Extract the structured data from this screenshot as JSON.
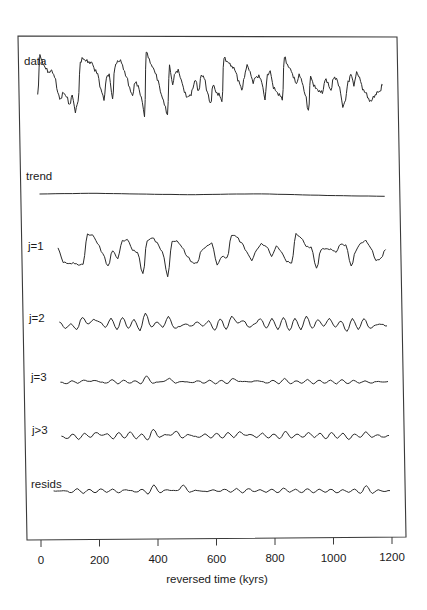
{
  "chart_data": {
    "type": "line",
    "title": "",
    "xlabel": "reversed time (kyrs)",
    "ylabel": "",
    "xlim": [
      0,
      1200
    ],
    "x_ticks": [
      0,
      200,
      400,
      600,
      800,
      1000,
      1200
    ],
    "x_tick_labels": [
      "0",
      "200",
      "400",
      "600",
      "800",
      "1000",
      "1200"
    ],
    "grid": false,
    "legend": null,
    "layout": "stacked panels sharing x-axis, one box frame",
    "series": [
      {
        "name": "data",
        "x_range": [
          0,
          1180
        ],
        "values": [
          0.15,
          0.92,
          0.78,
          0.66,
          0.6,
          0.62,
          0.52,
          0.18,
          0.05,
          0.2,
          0.1,
          -0.05,
          0.12,
          -0.18,
          0.0,
          0.78,
          0.88,
          0.82,
          0.8,
          0.78,
          0.65,
          0.55,
          0.25,
          0.05,
          0.48,
          0.55,
          0.05,
          0.72,
          0.8,
          0.84,
          0.66,
          0.5,
          0.28,
          0.12,
          0.42,
          0.3,
          0.1,
          -0.28,
          1.0,
          0.85,
          0.7,
          0.6,
          0.4,
          0.15,
          -0.05,
          -0.25,
          0.72,
          0.35,
          0.6,
          0.62,
          0.45,
          0.2,
          0.1,
          0.12,
          0.28,
          0.45,
          0.2,
          0.55,
          0.48,
          0.2,
          -0.05,
          0.35,
          0.2,
          0.15,
          0.02,
          0.88,
          0.82,
          0.75,
          0.7,
          0.6,
          0.4,
          0.25,
          0.5,
          0.75,
          0.58,
          0.4,
          0.5,
          0.52,
          0.4,
          0.05,
          0.55,
          0.6,
          0.3,
          0.2,
          0.15,
          0.05,
          0.9,
          0.75,
          0.65,
          0.52,
          0.35,
          0.55,
          0.4,
          0.15,
          -0.18,
          0.5,
          0.35,
          0.25,
          0.22,
          0.18,
          0.45,
          0.38,
          0.22,
          0.5,
          0.45,
          0.3,
          -0.1,
          0.05,
          0.4,
          0.55,
          0.35,
          0.58,
          0.5,
          0.25,
          0.2,
          0.05,
          0.02,
          0.12,
          0.18,
          0.22,
          0.35
        ]
      },
      {
        "name": "trend",
        "x_range": [
          0,
          1180
        ],
        "values": [
          0.0,
          0.04,
          0.08,
          0.05,
          0.0,
          -0.04,
          -0.08,
          -0.05,
          0.0,
          0.01,
          -0.05,
          -0.12,
          -0.18,
          -0.22,
          -0.25
        ]
      },
      {
        "name": "j=1",
        "x_range": [
          60,
          1180
        ],
        "values": [
          0.25,
          -0.35,
          -0.45,
          -0.4,
          -0.5,
          -0.45,
          0.9,
          0.85,
          0.5,
          0.0,
          -0.55,
          0.15,
          -0.2,
          0.6,
          0.65,
          0.2,
          0.05,
          -0.9,
          0.6,
          0.75,
          0.5,
          0.1,
          -1.0,
          0.55,
          0.6,
          0.3,
          -0.1,
          -0.4,
          -0.4,
          0.2,
          0.35,
          0.5,
          -0.5,
          -0.1,
          -0.2,
          0.85,
          0.8,
          0.5,
          0.1,
          -0.3,
          0.2,
          0.45,
          0.35,
          -0.1,
          0.35,
          0.1,
          -0.35,
          -0.4,
          0.9,
          0.75,
          0.35,
          0.3,
          -0.65,
          0.2,
          0.25,
          0.2,
          0.1,
          0.45,
          0.4,
          -0.55,
          0.15,
          0.5,
          0.6,
          0.3,
          -0.3,
          -0.2,
          0.2
        ]
      },
      {
        "name": "j=2",
        "x_range": [
          60,
          1180
        ],
        "values": [
          0.2,
          -0.4,
          0.0,
          -0.5,
          0.6,
          0.0,
          0.4,
          0.2,
          -0.3,
          0.5,
          -0.5,
          0.6,
          -0.4,
          0.4,
          -0.6,
          1.0,
          -0.3,
          0.2,
          -0.3,
          0.7,
          -0.4,
          -0.2,
          0.0,
          -0.2,
          0.2,
          -0.2,
          0.3,
          -0.6,
          0.5,
          -0.5,
          0.7,
          0.1,
          0.3,
          -0.3,
          0.0,
          0.5,
          -0.4,
          0.5,
          -0.5,
          0.6,
          -0.6,
          0.5,
          -0.5,
          0.7,
          -0.4,
          0.4,
          -0.2,
          0.5,
          -0.3,
          0.3,
          -0.7,
          0.5,
          -0.5,
          0.5,
          -0.4,
          -0.1,
          0.0,
          -0.2
        ]
      },
      {
        "name": "j=3",
        "x_range": [
          60,
          1180
        ],
        "values": [
          0,
          -0.3,
          0.2,
          -0.2,
          0.3,
          0.1,
          0.25,
          0,
          -0.2,
          0.4,
          -0.3,
          0.3,
          -0.2,
          0.2,
          -0.3,
          1.0,
          -0.2,
          0.0,
          0.1,
          0.6,
          -0.2,
          0.1,
          0.0,
          -0.1,
          0.2,
          -0.2,
          0.3,
          -0.3,
          0.3,
          -0.3,
          0.6,
          0.1,
          0.1,
          0,
          0.2,
          0.1,
          -0.2,
          0.3,
          -0.3,
          0.6,
          -0.3,
          0.2,
          -0.2,
          0.4,
          -0.3,
          0.3,
          -0.2,
          0.3,
          -0.3,
          0.4,
          -0.3,
          0.3,
          -0.2,
          0.2,
          -0.2,
          0.1,
          0,
          0.05
        ]
      },
      {
        "name": "j>3",
        "x_range": [
          60,
          1180
        ],
        "values": [
          0,
          -0.4,
          0.3,
          -0.5,
          0.4,
          -0.2,
          0.5,
          0.1,
          0.3,
          -0.4,
          0.5,
          -0.3,
          0.6,
          -0.4,
          0.3,
          -0.6,
          1.0,
          -0.2,
          0.2,
          0.1,
          0.7,
          -0.3,
          0.2,
          0,
          -0.2,
          0.3,
          -0.3,
          0.4,
          -0.3,
          0.5,
          -0.2,
          0.6,
          0.1,
          0.2,
          -0.2,
          0.4,
          -0.3,
          0.3,
          -0.4,
          0.7,
          -0.3,
          0.3,
          -0.2,
          0.5,
          -0.2,
          0.4,
          -0.4,
          0.5,
          -0.3,
          0.4,
          -0.5,
          0.3,
          -0.2,
          0.6,
          -0.2,
          0.2,
          -0.2,
          0.1
        ]
      },
      {
        "name": "resids",
        "x_range": [
          30,
          1180
        ],
        "values": [
          0,
          0,
          0.05,
          -0.3,
          0.4,
          -0.4,
          0.3,
          -0.3,
          0.35,
          -0.2,
          0.3,
          -0.3,
          0.2,
          0.1,
          -0.2,
          0.3,
          -0.5,
          1.0,
          -0.3,
          0.2,
          0.1,
          0.05,
          1.0,
          -0.2,
          0.1,
          0,
          -0.1,
          0.2,
          -0.1,
          0.3,
          -0.2,
          0.4,
          -0.3,
          0.4,
          -0.1,
          0.2,
          -0.2,
          0.3,
          -0.3,
          0.5,
          -0.2,
          0.3,
          -0.3,
          0.4,
          -0.3,
          0.3,
          -0.2,
          0.3,
          -0.3,
          0.2,
          -0.2,
          0.3,
          -0.4,
          0.9,
          -0.4,
          0.2,
          -0.1,
          0.1
        ]
      }
    ],
    "panel_labels": [
      "data",
      "trend",
      "j=1",
      "j=2",
      "j=3",
      "j>3",
      "resids"
    ]
  },
  "axis": {
    "xlabel": "reversed time (kyrs)",
    "ticks": [
      "0",
      "200",
      "400",
      "600",
      "800",
      "1000",
      "1200"
    ]
  },
  "panels": {
    "data": "data",
    "trend": "trend",
    "j1": "j=1",
    "j2": "j=2",
    "j3": "j=3",
    "jgt3": "j>3",
    "resids": "resids"
  },
  "colors": {
    "line": "#2a2a2a",
    "frame": "#3a3a3a",
    "background": "#ffffff"
  }
}
